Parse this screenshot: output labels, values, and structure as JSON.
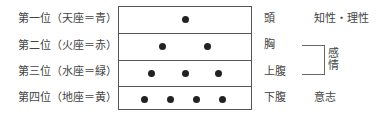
{
  "rows": [
    {
      "label": "第一位（天座＝青）",
      "dots": 1,
      "body_part": "頭"
    },
    {
      "label": "第二位（火座＝赤）",
      "dots": 2,
      "body_part": "胸"
    },
    {
      "label": "第三位（水座＝緑）",
      "dots": 3,
      "body_part": "上腹"
    },
    {
      "label": "第四位（地座＝黄）",
      "dots": 4,
      "body_part": "下腹"
    }
  ],
  "faculties": {
    "intellect": "知性・理性",
    "emotion": "感情",
    "will": "意志"
  }
}
